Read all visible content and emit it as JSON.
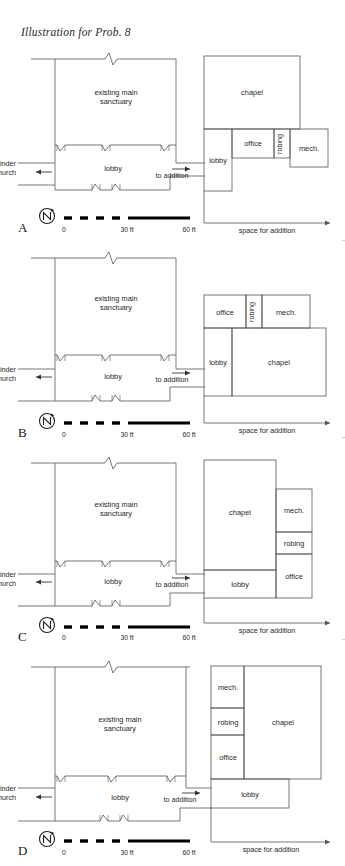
{
  "figure": {
    "title": "Illustration for Prob. 8",
    "domain_type": "architectural-floor-plan-diagram",
    "panel_count": 4
  },
  "common": {
    "existing_label_line1": "existing main",
    "existing_label_line2": "sanctuary",
    "lobby_label": "lobby",
    "to_remainder_line1": "to remainder",
    "to_remainder_line2": "of church",
    "to_addition_label": "to addition",
    "space_for_addition_label": "space for addition",
    "north_symbol": "N",
    "scale": {
      "zero_label": "0",
      "mid_label": "30 ft",
      "end_label": "60 ft",
      "ticks": [
        0,
        30,
        60
      ],
      "units": "ft"
    },
    "addition_rooms": [
      "chapel",
      "office",
      "robing",
      "mech."
    ],
    "colors": {
      "line": "#1f1f1f",
      "thin_line": "#555555",
      "text": "#1f1f1f",
      "background": "#ffffff",
      "scale_bar": "#000000"
    }
  },
  "panels": [
    {
      "letter": "A",
      "rooms": {
        "chapel": "chapel",
        "lobby": "lobby",
        "office": "office",
        "robing": "robing",
        "mech": "mech."
      },
      "arrangement": "chapel top-wide; lobby left column; office, robing, mech. in a row to the right of lobby under chapel"
    },
    {
      "letter": "B",
      "rooms": {
        "chapel": "chapel",
        "lobby": "lobby",
        "office": "office",
        "robing": "robing",
        "mech": "mech."
      },
      "arrangement": "office, robing, mech. in a top row; lobby left and chapel right on the lower band"
    },
    {
      "letter": "C",
      "rooms": {
        "chapel": "chapel",
        "lobby": "lobby",
        "office": "office",
        "robing": "robing",
        "mech": "mech."
      },
      "arrangement": "chapel tall on left with lobby beneath it; mech., robing, office stacked on the right"
    },
    {
      "letter": "D",
      "rooms": {
        "chapel": "chapel",
        "lobby": "lobby",
        "office": "office",
        "robing": "robing",
        "mech": "mech."
      },
      "arrangement": "mech., robing, office stacked at left; chapel tall at right; lobby spanning the bottom"
    }
  ]
}
